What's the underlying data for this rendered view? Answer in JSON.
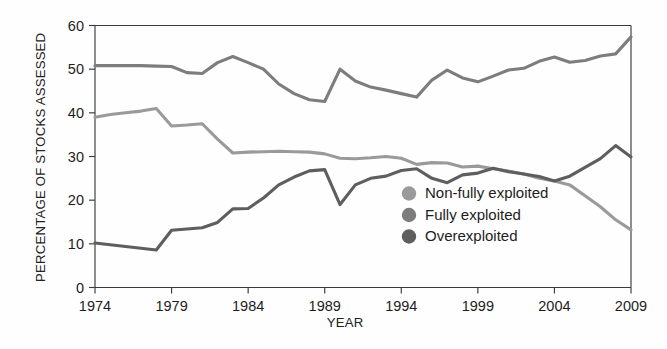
{
  "chart_data": {
    "type": "line",
    "title": "",
    "xlabel": "YEAR",
    "ylabel": "PERCENTAGE OF STOCKS ASSESSED",
    "xlim": [
      1974,
      2009
    ],
    "ylim": [
      0,
      60
    ],
    "xticks": [
      1974,
      1979,
      1984,
      1989,
      1994,
      1999,
      2004,
      2009
    ],
    "yticks": [
      0,
      10,
      20,
      30,
      40,
      50,
      60
    ],
    "grid": false,
    "legend_position": "center-right-inside",
    "x": [
      1974,
      1975,
      1976,
      1977,
      1978,
      1979,
      1980,
      1981,
      1982,
      1983,
      1984,
      1985,
      1986,
      1987,
      1988,
      1989,
      1990,
      1991,
      1992,
      1993,
      1994,
      1995,
      1996,
      1997,
      1998,
      1999,
      2000,
      2001,
      2002,
      2003,
      2004,
      2005,
      2006,
      2007,
      2008,
      2009
    ],
    "series": [
      {
        "name": "Non-fully exploited",
        "color": "#9a9a9a",
        "values": [
          39.0,
          39.6,
          40.0,
          40.4,
          41.0,
          37.0,
          37.2,
          37.5,
          34.0,
          30.8,
          31.0,
          31.1,
          31.2,
          31.1,
          31.0,
          30.6,
          29.6,
          29.5,
          29.7,
          30.0,
          29.6,
          28.2,
          28.6,
          28.5,
          27.6,
          27.8,
          27.2,
          26.7,
          26.0,
          25.0,
          24.4,
          23.5,
          21.0,
          18.5,
          15.5,
          13.2
        ]
      },
      {
        "name": "Fully exploited",
        "color": "#7d7d7d",
        "values": [
          50.8,
          50.8,
          50.8,
          50.8,
          50.7,
          50.6,
          49.2,
          49.0,
          51.5,
          52.9,
          51.5,
          50.0,
          46.6,
          44.4,
          43.0,
          42.6,
          50.0,
          47.3,
          45.9,
          45.2,
          44.4,
          43.6,
          47.5,
          49.8,
          48.0,
          47.1,
          48.4,
          49.8,
          50.2,
          51.8,
          52.8,
          51.6,
          52.0,
          53.0,
          53.5,
          57.4
        ]
      },
      {
        "name": "Overexploited",
        "color": "#5e5e5e",
        "values": [
          10.2,
          9.8,
          9.4,
          9.0,
          8.6,
          13.1,
          13.4,
          13.7,
          14.9,
          18.0,
          18.1,
          20.5,
          23.5,
          25.3,
          26.7,
          27.0,
          19.0,
          23.5,
          25.0,
          25.5,
          26.8,
          27.2,
          25.0,
          24.0,
          25.8,
          26.2,
          27.3,
          26.5,
          26.0,
          25.4,
          24.4,
          25.5,
          27.5,
          29.5,
          32.5,
          29.9
        ]
      }
    ],
    "legend": [
      {
        "label": "Non-fully exploited",
        "color": "#9a9a9a"
      },
      {
        "label": "Fully exploited",
        "color": "#7d7d7d"
      },
      {
        "label": "Overexploited",
        "color": "#5e5e5e"
      }
    ]
  }
}
